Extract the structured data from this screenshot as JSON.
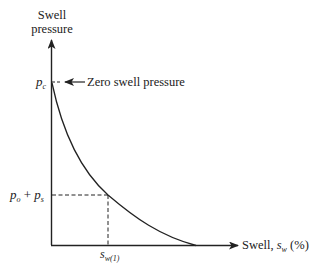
{
  "diagram": {
    "y_axis": {
      "label_line1": "Swell",
      "label_line2": "pressure"
    },
    "x_axis": {
      "label_prefix": "Swell, ",
      "label_symbol": "s",
      "label_subscript": "w",
      "label_suffix": " (%)"
    },
    "annotations": {
      "pc_symbol": "p",
      "pc_subscript": "c",
      "zero_swell_label": "Zero swell pressure",
      "po_symbol": "p",
      "po_subscript": "o",
      "plus": " + ",
      "ps_symbol": "p",
      "ps_subscript": "s",
      "sw1_symbol": "s",
      "sw1_subscript": "w(1)"
    },
    "curve": {
      "description": "Decreasing concave curve from zero swell pressure p_c at zero swell down to zero pressure",
      "points": [
        [
          52,
          84
        ],
        [
          60,
          120
        ],
        [
          80,
          160
        ],
        [
          108,
          195
        ],
        [
          130,
          212
        ],
        [
          160,
          232
        ],
        [
          195,
          245
        ]
      ]
    },
    "colors": {
      "line": "#222222",
      "background": "#ffffff"
    }
  }
}
